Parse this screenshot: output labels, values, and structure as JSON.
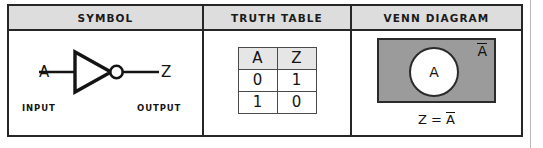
{
  "table": {
    "headers": [
      {
        "label": "SYMBOL",
        "name": "symbol"
      },
      {
        "label": "TRUTH TABLE",
        "name": "truth-table"
      },
      {
        "label": "VENN DIAGRAM",
        "name": "venn-diagram"
      }
    ]
  },
  "symbol": {
    "gate_type": "NOT gate (inverter)",
    "input_pin_label": "A",
    "output_pin_label": "Z",
    "input_caption": "INPUT",
    "output_caption": "OUTPUT",
    "icon": "inverter-triangle-with-bubble-icon"
  },
  "truth_table": {
    "columns": [
      "A",
      "Z"
    ],
    "rows": [
      [
        "0",
        "1"
      ],
      [
        "1",
        "0"
      ]
    ]
  },
  "venn": {
    "universe_label_base": "A",
    "universe_label_overline": true,
    "circle_label": "A",
    "equation_lhs": "Z",
    "equation_operator": "=",
    "equation_rhs_base": "A",
    "equation_rhs_overline": true
  },
  "colors": {
    "header_fill": "#dddddd",
    "venn_fill": "#9b9b9b",
    "circle_fill": "#ffffff",
    "line": "#262626",
    "truth_header_fill": "#e6e6e6",
    "page_edge_line": "#b9b9b9"
  }
}
